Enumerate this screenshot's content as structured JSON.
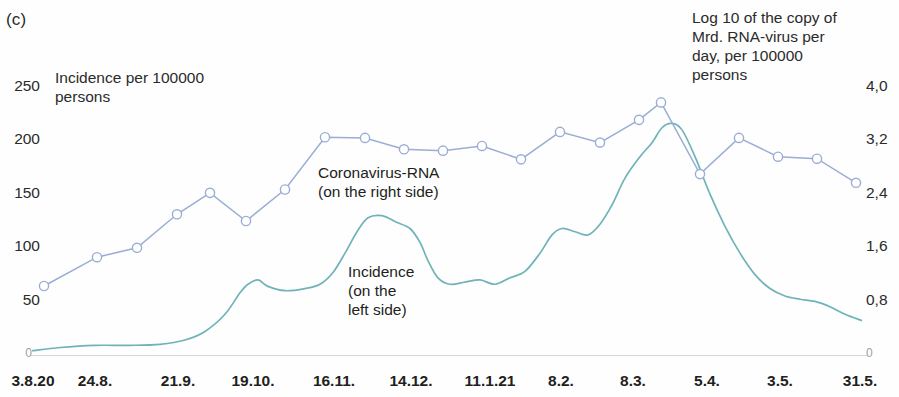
{
  "panel": {
    "label": "(c)"
  },
  "axes": {
    "left_title": "Incidence per 100000\npersons",
    "right_title": "Log 10 of the copy of\nMrd. RNA-virus per\nday, per 100000\npersons",
    "left_ticks": [
      "250",
      "200",
      "150",
      "100",
      "50",
      "0"
    ],
    "right_ticks": [
      "4,0",
      "3,2",
      "2,4",
      "1,6",
      "0,8",
      "0"
    ],
    "x_ticks": [
      "3.8.20",
      "24.8.",
      "21.9.",
      "19.10.",
      "16.11.",
      "14.12.",
      "11.1.21",
      "8.2.",
      "8.3.",
      "5.4.",
      "3.5.",
      "31.5."
    ]
  },
  "annotations": {
    "rna": "Coronavirus-RNA\n(on the right side)",
    "incidence": "Incidence\n(on the\nleft side)"
  },
  "colors": {
    "rna_line": "#9badd4",
    "rna_marker_fill": "#ffffff",
    "incidence_line": "#6fb3b8",
    "text": "#231f20",
    "baseline": "#cfd8da"
  },
  "chart_data": {
    "type": "line",
    "title": "",
    "xlabel": "",
    "ylabel": "Incidence per 100000 persons",
    "y2label": "Log 10 of the copy of Mrd. RNA-virus per day, per 100000 persons",
    "ylim": [
      0,
      250
    ],
    "y2lim": [
      0,
      4.0
    ],
    "grid": false,
    "legend": "inline-annotations",
    "x_tick_labels": [
      "3.8.20",
      "24.8.",
      "21.9.",
      "19.10.",
      "16.11.",
      "14.12.",
      "11.1.21",
      "8.2.",
      "8.3.",
      "5.4.",
      "3.5.",
      "31.5."
    ],
    "x_tick_positions": [
      0,
      21,
      49,
      77,
      105,
      133,
      161,
      189,
      217,
      245,
      273,
      301
    ],
    "series": [
      {
        "name": "Coronavirus-RNA (on the right side)",
        "axis": "right",
        "units": "log10 copies of Mrd. RNA-virus per day per 100000 persons",
        "markers": true,
        "x": [
          5,
          42,
          61,
          89,
          110,
          131,
          151,
          172,
          186,
          203,
          217,
          231,
          249,
          265,
          276,
          292,
          300
        ],
        "values": [
          1.03,
          1.45,
          1.58,
          2.1,
          2.65,
          2.82,
          2.5,
          3.21,
          3.18,
          3.0,
          2.98,
          3.26,
          3.1,
          3.45,
          3.61,
          2.75,
          3.15
        ],
        "values_note": "marker y-values read off right axis",
        "points": [
          {
            "x_px": 44,
            "value": 1.03
          },
          {
            "x_px": 97,
            "value": 1.46
          },
          {
            "x_px": 137,
            "value": 1.6
          },
          {
            "x_px": 177,
            "value": 2.1
          },
          {
            "x_px": 210,
            "value": 2.42
          },
          {
            "x_px": 246,
            "value": 2.0
          },
          {
            "x_px": 285,
            "value": 2.47
          },
          {
            "x_px": 325,
            "value": 3.25
          },
          {
            "x_px": 365,
            "value": 3.24
          },
          {
            "x_px": 404,
            "value": 3.07
          },
          {
            "x_px": 443,
            "value": 3.05
          },
          {
            "x_px": 482,
            "value": 3.12
          },
          {
            "x_px": 521,
            "value": 2.92
          },
          {
            "x_px": 560,
            "value": 3.33
          },
          {
            "x_px": 600,
            "value": 3.17
          },
          {
            "x_px": 639,
            "value": 3.51
          },
          {
            "x_px": 661,
            "value": 3.77
          },
          {
            "x_px": 700,
            "value": 2.7
          },
          {
            "x_px": 739,
            "value": 3.24
          },
          {
            "x_px": 778,
            "value": 2.96
          },
          {
            "x_px": 817,
            "value": 2.93
          },
          {
            "x_px": 856,
            "value": 2.57
          }
        ]
      },
      {
        "name": "Incidence (on the left side)",
        "axis": "left",
        "units": "incidence per 100000 persons",
        "markers": false,
        "key_points": [
          {
            "x_px": 32,
            "value": 4
          },
          {
            "x_px": 60,
            "value": 7
          },
          {
            "x_px": 95,
            "value": 9
          },
          {
            "x_px": 130,
            "value": 9
          },
          {
            "x_px": 160,
            "value": 10
          },
          {
            "x_px": 185,
            "value": 14
          },
          {
            "x_px": 205,
            "value": 22
          },
          {
            "x_px": 225,
            "value": 38
          },
          {
            "x_px": 240,
            "value": 58
          },
          {
            "x_px": 248,
            "value": 66
          },
          {
            "x_px": 258,
            "value": 70
          },
          {
            "x_px": 268,
            "value": 64
          },
          {
            "x_px": 285,
            "value": 60
          },
          {
            "x_px": 305,
            "value": 62
          },
          {
            "x_px": 320,
            "value": 66
          },
          {
            "x_px": 333,
            "value": 77
          },
          {
            "x_px": 345,
            "value": 95
          },
          {
            "x_px": 357,
            "value": 115
          },
          {
            "x_px": 368,
            "value": 128
          },
          {
            "x_px": 382,
            "value": 130
          },
          {
            "x_px": 396,
            "value": 124
          },
          {
            "x_px": 410,
            "value": 118
          },
          {
            "x_px": 420,
            "value": 105
          },
          {
            "x_px": 428,
            "value": 88
          },
          {
            "x_px": 438,
            "value": 72
          },
          {
            "x_px": 450,
            "value": 66
          },
          {
            "x_px": 465,
            "value": 68
          },
          {
            "x_px": 480,
            "value": 70
          },
          {
            "x_px": 495,
            "value": 66
          },
          {
            "x_px": 510,
            "value": 72
          },
          {
            "x_px": 525,
            "value": 78
          },
          {
            "x_px": 540,
            "value": 95
          },
          {
            "x_px": 552,
            "value": 112
          },
          {
            "x_px": 562,
            "value": 118
          },
          {
            "x_px": 575,
            "value": 115
          },
          {
            "x_px": 588,
            "value": 112
          },
          {
            "x_px": 600,
            "value": 122
          },
          {
            "x_px": 612,
            "value": 140
          },
          {
            "x_px": 625,
            "value": 165
          },
          {
            "x_px": 640,
            "value": 185
          },
          {
            "x_px": 652,
            "value": 198
          },
          {
            "x_px": 662,
            "value": 212
          },
          {
            "x_px": 672,
            "value": 216
          },
          {
            "x_px": 682,
            "value": 210
          },
          {
            "x_px": 695,
            "value": 185
          },
          {
            "x_px": 710,
            "value": 150
          },
          {
            "x_px": 725,
            "value": 120
          },
          {
            "x_px": 740,
            "value": 95
          },
          {
            "x_px": 755,
            "value": 75
          },
          {
            "x_px": 770,
            "value": 62
          },
          {
            "x_px": 785,
            "value": 55
          },
          {
            "x_px": 800,
            "value": 52
          },
          {
            "x_px": 815,
            "value": 50
          },
          {
            "x_px": 830,
            "value": 45
          },
          {
            "x_px": 845,
            "value": 38
          },
          {
            "x_px": 862,
            "value": 32
          }
        ]
      }
    ]
  },
  "geometry": {
    "plot_left_px": 30,
    "plot_right_px": 868,
    "y_zero_px": 355,
    "y_top_px": 87,
    "left_axis_max": 250,
    "right_axis_max": 4.0,
    "left_tick_y_px": [
      87,
      140,
      194,
      247,
      301,
      355
    ],
    "right_tick_y_px": [
      87,
      140,
      194,
      247,
      301,
      355
    ],
    "x_tick_x_px": [
      33,
      95,
      178,
      253,
      334,
      411,
      490,
      561,
      633,
      707,
      780,
      860
    ]
  }
}
